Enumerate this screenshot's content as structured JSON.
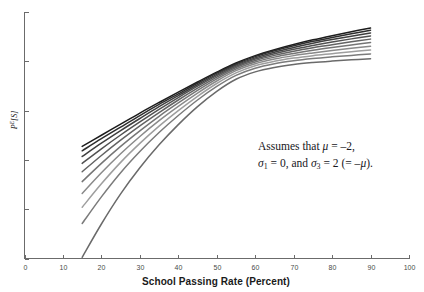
{
  "chart_data": {
    "type": "line",
    "title": "",
    "xlabel": "School Passing Rate (Percent)",
    "ylabel": "P^E[S]",
    "ylabel_base": "P",
    "ylabel_sup": "E",
    "ylabel_tail": "[S]",
    "xlim": [
      0,
      100
    ],
    "ylim": [
      0,
      1
    ],
    "grid": false,
    "legend": "none",
    "xticks": [
      0,
      10,
      20,
      30,
      40,
      50,
      60,
      70,
      80,
      90,
      100
    ],
    "xtick_labels": [
      "0",
      "10",
      "20",
      "30",
      "40",
      "50",
      "60",
      "70",
      "80",
      "90",
      "100"
    ],
    "yticks": [
      0.0,
      0.2,
      0.4,
      0.6,
      0.8,
      1.0
    ],
    "ytick_labels": [
      "",
      "",
      "",
      "",
      "",
      ""
    ],
    "x": [
      15,
      20,
      25,
      30,
      35,
      40,
      45,
      50,
      55,
      60,
      65,
      70,
      75,
      80,
      85,
      90
    ],
    "series": [
      {
        "name": "curve-1",
        "color": "#1c1c1c",
        "values": [
          0.455,
          0.5,
          0.545,
          0.59,
          0.633,
          0.675,
          0.716,
          0.756,
          0.793,
          0.823,
          0.847,
          0.868,
          0.887,
          0.904,
          0.92,
          0.935
        ]
      },
      {
        "name": "curve-2",
        "color": "#2d2d2d",
        "values": [
          0.437,
          0.486,
          0.533,
          0.58,
          0.625,
          0.668,
          0.711,
          0.752,
          0.789,
          0.819,
          0.843,
          0.863,
          0.881,
          0.897,
          0.912,
          0.926
        ]
      },
      {
        "name": "curve-3",
        "color": "#3f3f3f",
        "values": [
          0.414,
          0.468,
          0.519,
          0.568,
          0.616,
          0.661,
          0.705,
          0.747,
          0.785,
          0.814,
          0.837,
          0.856,
          0.873,
          0.888,
          0.902,
          0.915
        ]
      },
      {
        "name": "curve-4",
        "color": "#515151",
        "values": [
          0.386,
          0.445,
          0.501,
          0.554,
          0.605,
          0.653,
          0.699,
          0.742,
          0.78,
          0.809,
          0.831,
          0.849,
          0.864,
          0.878,
          0.891,
          0.903
        ]
      },
      {
        "name": "curve-5",
        "color": "#636363",
        "values": [
          0.352,
          0.418,
          0.48,
          0.538,
          0.592,
          0.643,
          0.691,
          0.736,
          0.775,
          0.803,
          0.824,
          0.841,
          0.855,
          0.867,
          0.879,
          0.89
        ]
      },
      {
        "name": "curve-6",
        "color": "#757575",
        "values": [
          0.312,
          0.386,
          0.455,
          0.518,
          0.577,
          0.631,
          0.682,
          0.729,
          0.769,
          0.797,
          0.817,
          0.832,
          0.845,
          0.856,
          0.866,
          0.876
        ]
      },
      {
        "name": "curve-7",
        "color": "#8a8a8a",
        "values": [
          0.264,
          0.348,
          0.425,
          0.495,
          0.559,
          0.617,
          0.671,
          0.72,
          0.762,
          0.79,
          0.809,
          0.823,
          0.834,
          0.844,
          0.853,
          0.861
        ]
      },
      {
        "name": "curve-8",
        "color": "#9e9e9e",
        "values": [
          0.208,
          0.303,
          0.39,
          0.467,
          0.537,
          0.6,
          0.658,
          0.71,
          0.753,
          0.782,
          0.8,
          0.813,
          0.823,
          0.831,
          0.839,
          0.846
        ]
      },
      {
        "name": "curve-9",
        "color": "#7b7b7b",
        "values": [
          0.142,
          0.25,
          0.348,
          0.434,
          0.511,
          0.58,
          0.643,
          0.698,
          0.743,
          0.772,
          0.79,
          0.802,
          0.811,
          0.818,
          0.824,
          0.83
        ]
      },
      {
        "name": "curve-10",
        "color": "#6a6a6a",
        "values": [
          0.005,
          0.14,
          0.262,
          0.368,
          0.461,
          0.543,
          0.616,
          0.678,
          0.727,
          0.757,
          0.775,
          0.787,
          0.795,
          0.801,
          0.806,
          0.81
        ]
      }
    ],
    "annotation": {
      "line1_prefix": "Assumes that ",
      "line1_mu": "μ",
      "line1_eq": " = –2,",
      "line2_sigma1": "σ",
      "line2_sub1": "1",
      "line2_mid": " = 0, and ",
      "line2_sigma3": "σ",
      "line2_sub3": "3",
      "line2_tail": " = 2 (= –",
      "line2_mu": "μ",
      "line2_end": ")."
    }
  }
}
